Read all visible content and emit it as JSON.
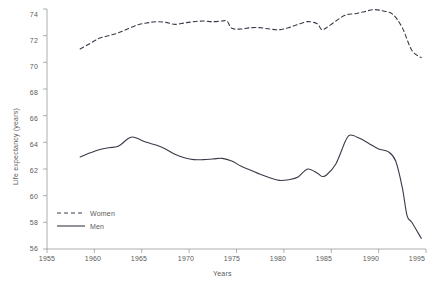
{
  "chart_data": {
    "type": "line",
    "title": "",
    "xlabel": "Years",
    "ylabel": "Life expectancy (years)",
    "xlim": [
      1955,
      1995
    ],
    "ylim": [
      56,
      74
    ],
    "xticks": [
      1955,
      1960,
      1965,
      1970,
      1975,
      1980,
      1985,
      1990,
      1995
    ],
    "yticks": [
      56,
      58,
      60,
      62,
      64,
      66,
      68,
      70,
      72,
      74
    ],
    "grid": false,
    "legend_position": "lower left",
    "series": [
      {
        "name": "Women",
        "style": "dashed",
        "color": "#3a3a4a",
        "x": [
          1958.5,
          1959.5,
          1960.5,
          1961.5,
          1962.5,
          1963.5,
          1964.5,
          1965.5,
          1966.5,
          1967.5,
          1968.5,
          1969.5,
          1970.5,
          1971.5,
          1972.5,
          1973.5,
          1974.0,
          1974.5,
          1975.5,
          1976.5,
          1977.5,
          1978.5,
          1979.5,
          1980.5,
          1981.5,
          1982.5,
          1983.5,
          1984.0,
          1984.5,
          1985.5,
          1986.5,
          1987.5,
          1988.5,
          1989.5,
          1990.5,
          1991.5,
          1992.5,
          1993.5,
          1994.5
        ],
        "y": [
          71.0,
          71.4,
          71.8,
          72.0,
          72.2,
          72.5,
          72.8,
          72.95,
          73.05,
          73.0,
          72.85,
          72.95,
          73.05,
          73.1,
          73.05,
          73.1,
          73.1,
          72.55,
          72.5,
          72.6,
          72.6,
          72.5,
          72.45,
          72.6,
          72.85,
          73.05,
          72.9,
          72.45,
          72.6,
          73.1,
          73.55,
          73.65,
          73.8,
          73.95,
          73.85,
          73.6,
          72.6,
          70.9,
          70.35
        ]
      },
      {
        "name": "Men",
        "style": "solid",
        "color": "#3a3a4a",
        "x": [
          1958.5,
          1959.5,
          1960.5,
          1961.5,
          1962.5,
          1963.5,
          1964.0,
          1964.5,
          1965.5,
          1966.5,
          1967.5,
          1968.5,
          1969.5,
          1970.5,
          1971.5,
          1972.5,
          1973.5,
          1974.5,
          1975.5,
          1976.5,
          1977.5,
          1978.5,
          1979.5,
          1980.5,
          1981.5,
          1982.5,
          1983.5,
          1984.0,
          1984.5,
          1985.5,
          1986.5,
          1987.0,
          1988.0,
          1989.0,
          1990.0,
          1991.0,
          1991.8,
          1992.5,
          1993.0,
          1993.5,
          1994.5
        ],
        "y": [
          62.9,
          63.2,
          63.45,
          63.6,
          63.7,
          64.25,
          64.4,
          64.3,
          64.0,
          63.8,
          63.5,
          63.1,
          62.85,
          62.7,
          62.7,
          62.75,
          62.8,
          62.6,
          62.2,
          61.9,
          61.6,
          61.35,
          61.15,
          61.2,
          61.4,
          62.0,
          61.7,
          61.45,
          61.55,
          62.4,
          64.1,
          64.55,
          64.3,
          63.9,
          63.5,
          63.3,
          62.6,
          60.6,
          58.5,
          58.0,
          56.8
        ]
      }
    ]
  },
  "axes": {
    "x_tick_labels": [
      "1955",
      "1960",
      "1965",
      "1970",
      "1975",
      "1980",
      "1985",
      "1990",
      "1995"
    ],
    "y_tick_labels": [
      "56",
      "58",
      "60",
      "62",
      "64",
      "66",
      "68",
      "70",
      "72",
      "74"
    ],
    "x_axis_title": "Years",
    "y_axis_title": "Life expectancy (years)"
  },
  "legend": {
    "items": [
      {
        "label": "Women",
        "style": "dashed"
      },
      {
        "label": "Men",
        "style": "solid"
      }
    ]
  },
  "colors": {
    "line": "#3a3a4a",
    "axis": "#9a9a9a",
    "text": "#5a5a5a",
    "background": "#ffffff"
  }
}
